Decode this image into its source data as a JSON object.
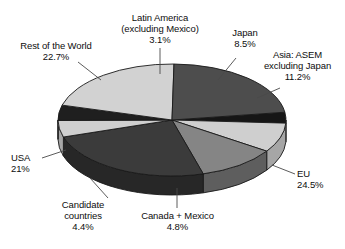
{
  "chart_data": {
    "type": "pie",
    "title": "",
    "subtitle": "",
    "xlabel": "",
    "ylabel": "",
    "legend_position": "none",
    "grid": false,
    "three_d": true,
    "labels_outside": true,
    "unit": "%",
    "total": 100.2,
    "categories": [
      "Latin America (excluding Mexico)",
      "Japan",
      "Asia: ASEM excluding Japan",
      "EU",
      "Canada + Mexico",
      "Candidate countries",
      "USA",
      "Rest of the World"
    ],
    "values": [
      3.1,
      8.5,
      11.2,
      24.5,
      4.8,
      4.4,
      21,
      22.7
    ],
    "slices": [
      {
        "key": "latin-america",
        "name": "Latin America",
        "name_line1": "Latin America",
        "name_line2": "(excluding Mexico)",
        "value": 3.1,
        "value_text": "3.1%",
        "color": "#161616",
        "side_color": "#0c0c0c",
        "start_deg": 352.0,
        "end_deg": 363.2
      },
      {
        "key": "japan",
        "name": "Japan",
        "name_line1": "Japan",
        "value": 8.5,
        "value_text": "8.5%",
        "color": "#cfcfcf",
        "side_color": "#a6a6a6",
        "start_deg": 363.2,
        "end_deg": 393.8
      },
      {
        "key": "asia-asem",
        "name": "Asia: ASEM excluding Japan",
        "name_line1": "Asia: ASEM",
        "name_line2": "excluding Japan",
        "value": 11.2,
        "value_text": "11.2%",
        "color": "#858585",
        "side_color": "#5e5e5e",
        "start_deg": 393.8,
        "end_deg": 434.1
      },
      {
        "key": "eu",
        "name": "EU",
        "name_line1": "EU",
        "value": 24.5,
        "value_text": "24.5%",
        "color": "#3b3b3b",
        "side_color": "#272727",
        "start_deg": 434.1,
        "end_deg": 522.3
      },
      {
        "key": "canada-mexico",
        "name": "Canada + Mexico",
        "name_line1": "Canada + Mexico",
        "value": 4.8,
        "value_text": "4.8%",
        "color": "#cfcfcf",
        "side_color": "#a6a6a6",
        "start_deg": 522.3,
        "end_deg": 539.6
      },
      {
        "key": "candidate-countries",
        "name": "Candidate countries",
        "name_line1": "Candidate",
        "name_line2": "countries",
        "value": 4.4,
        "value_text": "4.4%",
        "color": "#1f1f1f",
        "side_color": "#121212",
        "start_deg": 539.6,
        "end_deg": 555.4
      },
      {
        "key": "usa",
        "name": "USA",
        "name_line1": "USA",
        "value": 21,
        "value_text": "21%",
        "color": "#d2d2d2",
        "side_color": "#a9a9a9",
        "start_deg": 555.4,
        "end_deg": 631.0
      },
      {
        "key": "rest-of-world",
        "name": "Rest of the World",
        "name_line1": "Rest of the World",
        "value": 22.7,
        "value_text": "22.7%",
        "color": "#4d4d4d",
        "side_color": "#343434",
        "start_deg": 631.0,
        "end_deg": 712.0
      }
    ],
    "geometry": {
      "cx": 172,
      "cy": 120,
      "rx": 114,
      "ry": 56,
      "depth": 19
    },
    "colors": {
      "background": "#ffffff",
      "outline": "#1a1a1a",
      "label_text": "#0d0d0d",
      "leader_line": "#4a4a4a"
    }
  }
}
